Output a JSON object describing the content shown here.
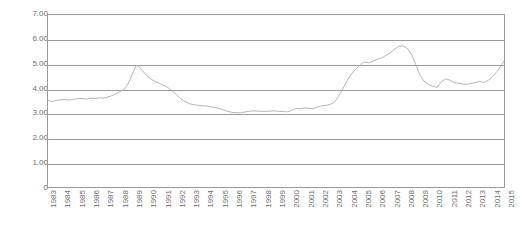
{
  "chart_data": {
    "type": "line",
    "title": "",
    "subtitle": "",
    "xlabel": "",
    "ylabel": "",
    "grid": true,
    "legend": false,
    "legend_position": "none",
    "line_color": "#b3b3b3",
    "axis_color": "#9a9a9a",
    "tick_text_color": "#6e6e6e",
    "background": "#ffffff",
    "ylim": [
      0,
      7
    ],
    "ytick_labels": [
      "7.00",
      "6.00",
      "5.00",
      "4.00",
      "3.00",
      "2.00",
      "1.00",
      "0"
    ],
    "ytick_values": [
      7,
      6,
      5,
      4,
      3,
      2,
      1,
      0
    ],
    "xlim": [
      1983,
      2015
    ],
    "xtick_labels": [
      "1983",
      "1984",
      "1985",
      "1986",
      "1987",
      "1988",
      "1989",
      "1990",
      "1991",
      "1992",
      "1993",
      "1994",
      "1995",
      "1996",
      "1997",
      "1998",
      "1999",
      "2000",
      "2001",
      "2002",
      "2003",
      "2004",
      "2005",
      "2006",
      "2007",
      "2008",
      "2009",
      "2010",
      "2011",
      "2012",
      "2013",
      "2014",
      "2015"
    ],
    "categories": [
      1983,
      1984,
      1985,
      1986,
      1987,
      1988,
      1989,
      1990,
      1991,
      1992,
      1993,
      1994,
      1995,
      1996,
      1997,
      1998,
      1999,
      2000,
      2001,
      2002,
      2003,
      2004,
      2005,
      2006,
      2007,
      2008,
      2009,
      2010,
      2011,
      2012,
      2013,
      2014,
      2015
    ],
    "series": [
      {
        "name": "series-1",
        "x": [
          1983.0,
          1983.3,
          1983.6,
          1983.9,
          1984.2,
          1984.5,
          1984.8,
          1985.1,
          1985.4,
          1985.7,
          1986.0,
          1986.3,
          1986.6,
          1986.9,
          1987.2,
          1987.5,
          1987.8,
          1988.1,
          1988.4,
          1988.7,
          1989.0,
          1989.2,
          1989.4,
          1989.6,
          1989.9,
          1990.2,
          1990.5,
          1990.8,
          1991.1,
          1991.4,
          1991.7,
          1992.0,
          1992.3,
          1992.6,
          1992.9,
          1993.2,
          1993.5,
          1993.8,
          1994.1,
          1994.4,
          1994.7,
          1995.0,
          1995.3,
          1995.6,
          1995.9,
          1996.2,
          1996.5,
          1996.8,
          1997.1,
          1997.4,
          1997.7,
          1998.0,
          1998.3,
          1998.6,
          1998.9,
          1999.2,
          1999.5,
          1999.8,
          2000.1,
          2000.4,
          2000.7,
          2001.0,
          2001.3,
          2001.6,
          2001.9,
          2002.2,
          2002.5,
          2002.8,
          2003.1,
          2003.4,
          2003.7,
          2004.0,
          2004.3,
          2004.6,
          2004.9,
          2005.2,
          2005.5,
          2005.8,
          2006.1,
          2006.4,
          2006.7,
          2007.0,
          2007.3,
          2007.6,
          2007.9,
          2008.2,
          2008.5,
          2008.8,
          2009.1,
          2009.4,
          2009.7,
          2010.0,
          2010.3,
          2010.6,
          2010.9,
          2011.2,
          2011.5,
          2011.8,
          2012.1,
          2012.4,
          2012.7,
          2013.0,
          2013.3,
          2013.6,
          2013.9,
          2014.2,
          2014.5,
          2014.8,
          2015.0
        ],
        "values": [
          3.52,
          3.48,
          3.52,
          3.55,
          3.56,
          3.54,
          3.57,
          3.6,
          3.6,
          3.58,
          3.62,
          3.6,
          3.63,
          3.62,
          3.66,
          3.72,
          3.8,
          3.9,
          4.0,
          4.3,
          4.7,
          4.95,
          4.9,
          4.75,
          4.55,
          4.4,
          4.3,
          4.22,
          4.15,
          4.05,
          3.92,
          3.78,
          3.6,
          3.48,
          3.4,
          3.35,
          3.33,
          3.3,
          3.3,
          3.26,
          3.24,
          3.2,
          3.14,
          3.08,
          3.04,
          3.02,
          3.02,
          3.05,
          3.08,
          3.1,
          3.09,
          3.08,
          3.08,
          3.09,
          3.1,
          3.08,
          3.07,
          3.06,
          3.12,
          3.2,
          3.18,
          3.22,
          3.2,
          3.18,
          3.25,
          3.3,
          3.32,
          3.36,
          3.45,
          3.7,
          4.0,
          4.35,
          4.6,
          4.8,
          4.95,
          5.1,
          5.05,
          5.12,
          5.2,
          5.25,
          5.35,
          5.45,
          5.6,
          5.72,
          5.75,
          5.65,
          5.4,
          5.0,
          4.55,
          4.3,
          4.18,
          4.1,
          4.05,
          4.28,
          4.4,
          4.35,
          4.25,
          4.22,
          4.2,
          4.18,
          4.22,
          4.25,
          4.3,
          4.25,
          4.35,
          4.5,
          4.7,
          4.95,
          5.12
        ]
      }
    ]
  }
}
